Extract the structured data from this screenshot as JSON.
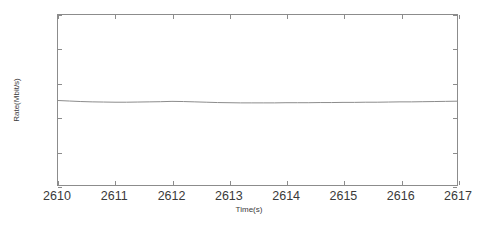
{
  "chart_data": {
    "type": "line",
    "title": "",
    "xlabel": "Time(s)",
    "ylabel": "Rate(Mbit/s)",
    "xlim": [
      2610,
      2617
    ],
    "ylim": [
      6,
      7
    ],
    "xticks": [
      2610,
      2611,
      2612,
      2613,
      2614,
      2615,
      2616,
      2617
    ],
    "xtick_labels": [
      "2610",
      "2611",
      "2612",
      "2613",
      "2614",
      "2615",
      "2616",
      "2617"
    ],
    "yticks": [
      6,
      6.2,
      6.4,
      6.6,
      6.8,
      7
    ],
    "ytick_labels": [
      "6",
      "6.2",
      "6.4",
      "6.6",
      "6.8",
      "7"
    ],
    "grid": false,
    "legend": null,
    "line_color": "#8c8c8c",
    "axis_color": "#8c8c8c",
    "background_color": "#ffffff",
    "series": [
      {
        "name": "Rate",
        "x": [
          2610.0,
          2610.2,
          2610.4,
          2610.6,
          2610.8,
          2611.0,
          2611.2,
          2611.4,
          2611.6,
          2611.8,
          2612.0,
          2612.2,
          2612.4,
          2612.6,
          2612.8,
          2613.0,
          2613.2,
          2613.4,
          2613.6,
          2613.8,
          2614.0,
          2614.2,
          2614.4,
          2614.6,
          2614.8,
          2615.0,
          2615.2,
          2615.4,
          2615.6,
          2615.8,
          2616.0,
          2616.2,
          2616.4,
          2616.6,
          2616.8,
          2617.0
        ],
        "y": [
          6.497,
          6.494,
          6.491,
          6.489,
          6.488,
          6.487,
          6.487,
          6.488,
          6.489,
          6.49,
          6.492,
          6.491,
          6.489,
          6.487,
          6.485,
          6.484,
          6.483,
          6.483,
          6.483,
          6.483,
          6.484,
          6.484,
          6.484,
          6.485,
          6.485,
          6.486,
          6.486,
          6.487,
          6.487,
          6.488,
          6.489,
          6.489,
          6.49,
          6.491,
          6.492,
          6.493
        ]
      }
    ]
  }
}
